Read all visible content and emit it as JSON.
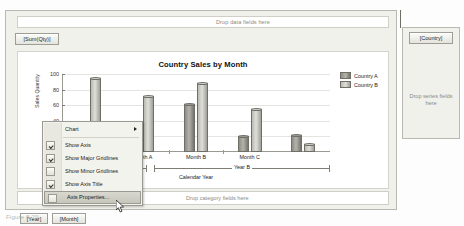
{
  "designer": {
    "data_zone": {
      "placeholder": "Drop data fields here",
      "field_button": "[Sum(Qty)]"
    },
    "category_zone": {
      "placeholder": "Drop category fields here",
      "field_buttons": [
        "[Year]",
        "[Month]"
      ]
    },
    "series_panel": {
      "placeholder": "Drop series fields here",
      "field_button": "[Country]"
    }
  },
  "context_menu": {
    "items": [
      {
        "label": "Chart",
        "checkbox": false,
        "checked": false,
        "submenu": true,
        "highlighted": false
      },
      {
        "label": "Show Axis",
        "checkbox": true,
        "checked": true,
        "submenu": false,
        "highlighted": false
      },
      {
        "label": "Show Major Gridlines",
        "checkbox": true,
        "checked": true,
        "submenu": false,
        "highlighted": false
      },
      {
        "label": "Show Minor Gridlines",
        "checkbox": true,
        "checked": false,
        "submenu": false,
        "highlighted": false
      },
      {
        "label": "Show Axis Title",
        "checkbox": true,
        "checked": true,
        "submenu": false,
        "highlighted": false
      },
      {
        "label": "Axis Properties...",
        "checkbox": true,
        "checked": false,
        "submenu": false,
        "highlighted": true
      }
    ]
  },
  "caption": "Figure 8-29.",
  "colors": {
    "series_a": "#8d8d86",
    "series_b": "#cfcfc9",
    "panel": "#f1f1ec",
    "menu_highlight": "#cdcdc3"
  },
  "chart_data": {
    "type": "bar",
    "title": "Country Sales by Month",
    "xlabel": "Calendar Year",
    "ylabel": "Sales Quantity",
    "ylim": [
      0,
      100
    ],
    "yticks": [
      20,
      40,
      60,
      80,
      100
    ],
    "grid": true,
    "legend_position": "top-right",
    "categories": [
      "Month C",
      "Month A",
      "Month B",
      "Month C"
    ],
    "group_label": "Year B",
    "series": [
      {
        "name": "Country A",
        "values": [
          30,
          25,
          62,
          20
        ]
      },
      {
        "name": "Country B",
        "values": [
          95,
          72,
          88,
          55
        ]
      }
    ],
    "trailing_bars": [
      22,
      10
    ]
  }
}
